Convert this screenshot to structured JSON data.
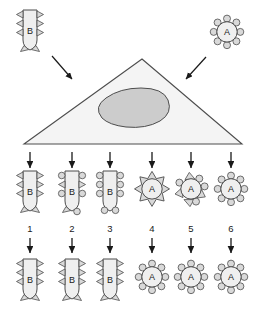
{
  "figure": {
    "title": "",
    "background": "#ffffff",
    "colors": {
      "outline": "#4d4d4d",
      "body_fill": "#efefef",
      "receptor_fill": "#d9d9d9",
      "nucleus_fill": "#cccccc",
      "cell_fill": "#f4f4f4",
      "arrow": "#1a1a1a",
      "text": "#1a1a1a"
    }
  },
  "top_row": {
    "left_organism": {
      "label": "B",
      "shape": "rod-bacillus",
      "receptors": "triangle",
      "receptor_count": 8
    },
    "right_organism": {
      "label": "A",
      "shape": "coccus-circle",
      "receptors": "circle",
      "receptor_count": 8
    },
    "arrows": [
      {
        "name": "arrow-left-to-cell"
      },
      {
        "name": "arrow-right-to-cell"
      }
    ]
  },
  "center_cell": {
    "shape": "triangle",
    "nucleus": "ellipse",
    "label": ""
  },
  "middle_row": {
    "items": [
      {
        "number": "1",
        "label": "B",
        "shape": "rod-bacillus",
        "receptors": "triangle"
      },
      {
        "number": "2",
        "label": "B",
        "shape": "rod-bacillus",
        "receptors": "mixed"
      },
      {
        "number": "3",
        "label": "B",
        "shape": "rod-bacillus",
        "receptors": "circle"
      },
      {
        "number": "4",
        "label": "A",
        "shape": "coccus-circle",
        "receptors": "triangle"
      },
      {
        "number": "5",
        "label": "A",
        "shape": "coccus-circle",
        "receptors": "mixed"
      },
      {
        "number": "6",
        "label": "A",
        "shape": "coccus-circle",
        "receptors": "circle"
      }
    ]
  },
  "bottom_row": {
    "items": [
      {
        "label": "B",
        "shape": "rod-bacillus",
        "receptors": "triangle"
      },
      {
        "label": "B",
        "shape": "rod-bacillus",
        "receptors": "triangle"
      },
      {
        "label": "B",
        "shape": "rod-bacillus",
        "receptors": "triangle"
      },
      {
        "label": "A",
        "shape": "coccus-circle",
        "receptors": "circle"
      },
      {
        "label": "A",
        "shape": "coccus-circle",
        "receptors": "circle"
      },
      {
        "label": "A",
        "shape": "coccus-circle",
        "receptors": "circle"
      }
    ]
  }
}
